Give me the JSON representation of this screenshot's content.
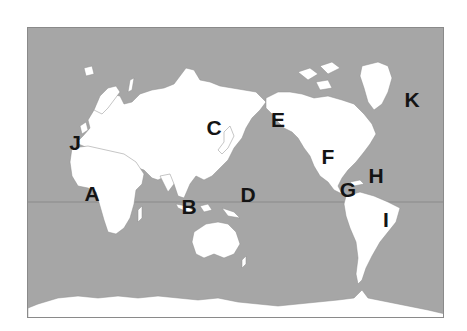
{
  "map": {
    "type": "world-political-outline",
    "projection": "pacific-centered",
    "colors": {
      "ocean": "#a6a6a6",
      "land": "#ffffff",
      "borders": "#8c8c8c",
      "equator": "#8a8a8a",
      "labels": "#141414"
    },
    "labels": [
      {
        "id": "A",
        "text": "A",
        "region": "Central Africa",
        "x": 91,
        "y": 192
      },
      {
        "id": "B",
        "text": "B",
        "region": "Indonesia",
        "x": 188,
        "y": 205
      },
      {
        "id": "C",
        "text": "C",
        "region": "Northeast Asia",
        "x": 213,
        "y": 126
      },
      {
        "id": "D",
        "text": "D",
        "region": "Pacific Ocean",
        "x": 247,
        "y": 193
      },
      {
        "id": "E",
        "text": "E",
        "region": "Bering Strait / Alaska",
        "x": 277,
        "y": 118
      },
      {
        "id": "F",
        "text": "F",
        "region": "United States",
        "x": 327,
        "y": 155
      },
      {
        "id": "G",
        "text": "G",
        "region": "Central America",
        "x": 347,
        "y": 188
      },
      {
        "id": "H",
        "text": "H",
        "region": "Caribbean",
        "x": 375,
        "y": 174
      },
      {
        "id": "I",
        "text": "I",
        "region": "South America",
        "x": 385,
        "y": 218
      },
      {
        "id": "J",
        "text": "J",
        "region": "Europe",
        "x": 74,
        "y": 141
      },
      {
        "id": "K",
        "text": "K",
        "region": "Greenland",
        "x": 411,
        "y": 98
      }
    ]
  }
}
